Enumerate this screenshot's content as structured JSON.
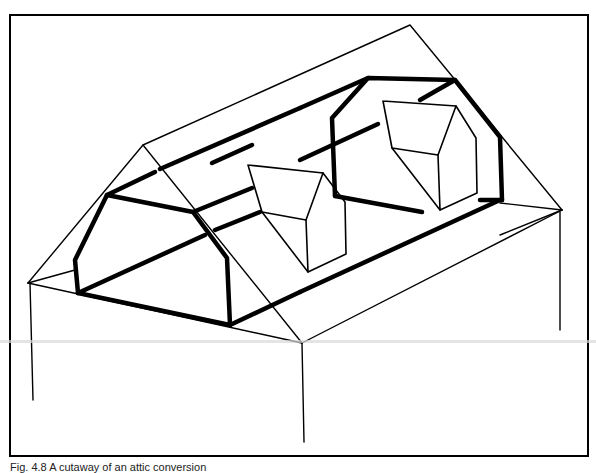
{
  "figure": {
    "caption": "Fig. 4.8  A cutaway of an attic conversion",
    "stroke_color": "#000000",
    "background": "#ffffff"
  }
}
